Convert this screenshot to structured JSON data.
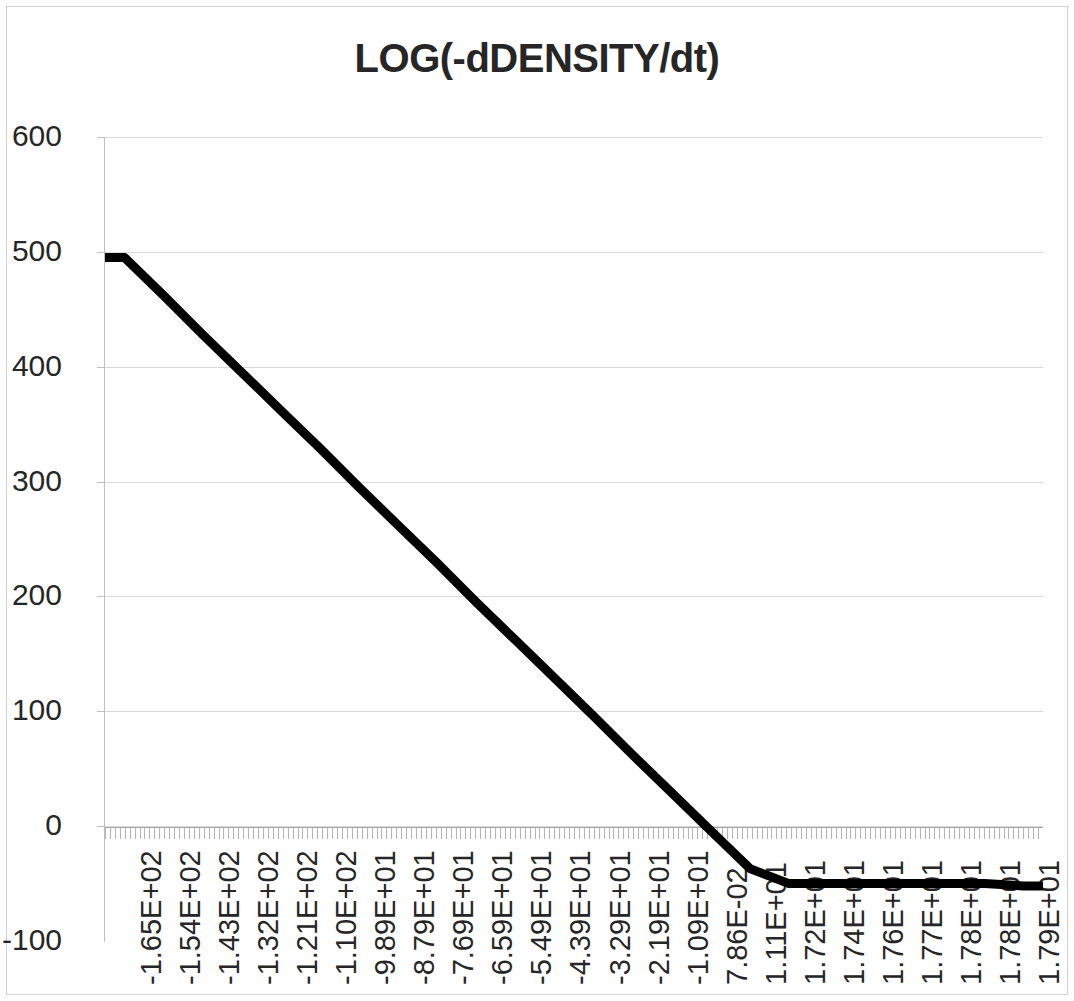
{
  "chart_data": {
    "type": "line",
    "title": "LOG(-dDENSITY/dt)",
    "xlabel": "",
    "ylabel": "",
    "ylim": [
      -100,
      600
    ],
    "yticks": [
      600,
      500,
      400,
      300,
      200,
      100,
      0,
      -100
    ],
    "grid": true,
    "legend": "none",
    "line_color": "#000000",
    "grid_color": "#d9d9d9",
    "axis_color": "#bfbfbf",
    "categories": [
      "-1.65E+02",
      "-1.54E+02",
      "-1.43E+02",
      "-1.32E+02",
      "-1.21E+02",
      "-1.10E+02",
      "-9.89E+01",
      "-8.79E+01",
      "-7.69E+01",
      "-6.59E+01",
      "-5.49E+01",
      "-4.39E+01",
      "-3.29E+01",
      "-2.19E+01",
      "-1.09E+01",
      "7.86E-02",
      "1.11E+01",
      "1.72E+01",
      "1.74E+01",
      "1.76E+01",
      "1.77E+01",
      "1.78E+01",
      "1.78E+01",
      "1.79E+01"
    ],
    "series": [
      {
        "name": "LOG(-dDENSITY/dt)",
        "x": [
          -165.0,
          -154.0,
          -143.0,
          -132.0,
          -121.0,
          -110.0,
          -98.9,
          -87.9,
          -76.9,
          -65.9,
          -54.9,
          -43.9,
          -32.9,
          -21.9,
          -10.9,
          0.0786,
          11.1,
          17.2,
          17.4,
          17.6,
          17.7,
          17.8,
          17.8,
          17.9
        ],
        "values": [
          495,
          462,
          428,
          395,
          362,
          329,
          295,
          262,
          229,
          195,
          162,
          129,
          96,
          62,
          29,
          -4,
          -37,
          -50,
          -50,
          -50,
          -50,
          -50,
          -50,
          -52
        ]
      }
    ],
    "annotations": [
      {
        "text": "linear decline from 495 to about -50",
        "x_start": "-1.65E+02",
        "x_end": "1.72E+01"
      },
      {
        "text": "flat plateau near -50",
        "x_start": "1.72E+01",
        "x_end": "1.79E+01"
      }
    ]
  },
  "chart": {
    "title": "LOG(-dDENSITY/dt)",
    "y_axis": {
      "labels": [
        "600",
        "500",
        "400",
        "300",
        "200",
        "100",
        "0",
        "-100"
      ]
    },
    "x_axis": {
      "labels": [
        "-1.65E+02",
        "-1.54E+02",
        "-1.43E+02",
        "-1.32E+02",
        "-1.21E+02",
        "-1.10E+02",
        "-9.89E+01",
        "-8.79E+01",
        "-7.69E+01",
        "-6.59E+01",
        "-5.49E+01",
        "-4.39E+01",
        "-3.29E+01",
        "-2.19E+01",
        "-1.09E+01",
        "7.86E-02",
        "1.11E+01",
        "1.72E+01",
        "1.74E+01",
        "1.76E+01",
        "1.77E+01",
        "1.78E+01",
        "1.78E+01",
        "1.79E+01"
      ]
    }
  }
}
